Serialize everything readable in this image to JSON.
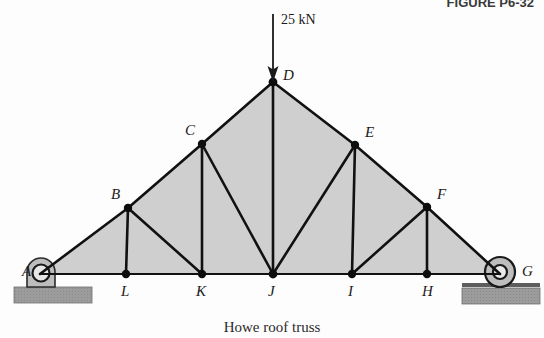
{
  "figure": {
    "id_label": "FIGURE P6-32",
    "caption": "Howe roof truss",
    "colors": {
      "panel_fill": "#cfcfcf",
      "member_stroke": "#111111",
      "ground_fill": "#9c9c9c",
      "background": "#fdfdfd"
    }
  },
  "load": {
    "label": "25 kN",
    "applied_at": "D",
    "direction": "down",
    "arrow_icon": "down-arrow-icon"
  },
  "supports": {
    "left": {
      "label": "A",
      "type": "pin",
      "icon": "pin-support-icon"
    },
    "right": {
      "label": "G",
      "type": "roller",
      "icon": "roller-support-icon"
    }
  },
  "nodes": [
    {
      "name": "A",
      "label": "A",
      "x": 40,
      "y": 274,
      "label_dx": -18,
      "label_dy": 2
    },
    {
      "name": "B",
      "label": "B",
      "x": 128,
      "y": 208,
      "label_dx": -17,
      "label_dy": -9
    },
    {
      "name": "C",
      "label": "C",
      "x": 202,
      "y": 144,
      "label_dx": -17,
      "label_dy": -9
    },
    {
      "name": "D",
      "label": "D",
      "x": 273,
      "y": 82,
      "label_dx": 10,
      "label_dy": -2
    },
    {
      "name": "E",
      "label": "E",
      "x": 355,
      "y": 145,
      "label_dx": 10,
      "label_dy": -8
    },
    {
      "name": "F",
      "label": "F",
      "x": 427,
      "y": 207,
      "label_dx": 10,
      "label_dy": -8
    },
    {
      "name": "G",
      "label": "G",
      "x": 500,
      "y": 274,
      "label_dx": 22,
      "label_dy": 2
    },
    {
      "name": "H",
      "label": "H",
      "x": 427,
      "y": 274,
      "label_dx": -4,
      "label_dy": 22
    },
    {
      "name": "I",
      "label": "I",
      "x": 352,
      "y": 274,
      "label_dx": -3,
      "label_dy": 22
    },
    {
      "name": "J",
      "label": "J",
      "x": 273,
      "y": 274,
      "label_dx": -4,
      "label_dy": 22
    },
    {
      "name": "K",
      "label": "K",
      "x": 202,
      "y": 274,
      "label_dx": -5,
      "label_dy": 22
    },
    {
      "name": "L",
      "label": "L",
      "x": 126,
      "y": 274,
      "label_dx": -4,
      "label_dy": 22
    }
  ],
  "members": [
    {
      "from": "A",
      "to": "B",
      "kind": "top-chord"
    },
    {
      "from": "B",
      "to": "C",
      "kind": "top-chord"
    },
    {
      "from": "C",
      "to": "D",
      "kind": "top-chord"
    },
    {
      "from": "D",
      "to": "E",
      "kind": "top-chord"
    },
    {
      "from": "E",
      "to": "F",
      "kind": "top-chord"
    },
    {
      "from": "F",
      "to": "G",
      "kind": "top-chord"
    },
    {
      "from": "A",
      "to": "L",
      "kind": "bottom-chord"
    },
    {
      "from": "L",
      "to": "K",
      "kind": "bottom-chord"
    },
    {
      "from": "K",
      "to": "J",
      "kind": "bottom-chord"
    },
    {
      "from": "J",
      "to": "I",
      "kind": "bottom-chord"
    },
    {
      "from": "I",
      "to": "H",
      "kind": "bottom-chord"
    },
    {
      "from": "H",
      "to": "G",
      "kind": "bottom-chord"
    },
    {
      "from": "B",
      "to": "L",
      "kind": "vertical"
    },
    {
      "from": "C",
      "to": "K",
      "kind": "vertical"
    },
    {
      "from": "D",
      "to": "J",
      "kind": "vertical"
    },
    {
      "from": "E",
      "to": "I",
      "kind": "vertical"
    },
    {
      "from": "F",
      "to": "H",
      "kind": "vertical"
    },
    {
      "from": "B",
      "to": "K",
      "kind": "diagonal"
    },
    {
      "from": "C",
      "to": "J",
      "kind": "diagonal"
    },
    {
      "from": "E",
      "to": "J",
      "kind": "diagonal"
    },
    {
      "from": "F",
      "to": "I",
      "kind": "diagonal"
    }
  ]
}
